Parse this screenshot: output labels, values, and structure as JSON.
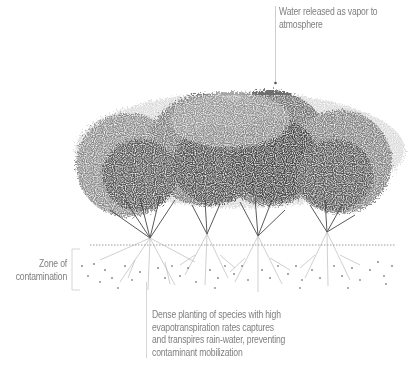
{
  "diagram": {
    "type": "phytoremediation-section",
    "annotations": {
      "top": "Water released as vapor to atmosphere",
      "top_lines": [
        "Water released as vapor to",
        "atmosphere"
      ],
      "left_lines": [
        "Zone of",
        "contamination"
      ],
      "bottom_lines": [
        "Dense planting of species with high",
        "evapotranspiration rates captures",
        "and transpires rain-water, preventing",
        "contaminant mobilization"
      ]
    },
    "elements": {
      "shrubs": 4,
      "ground_line": "dotted",
      "contaminant_particles": "scattered dots below ground line"
    },
    "colors": {
      "foliage_dark": "#3a3a3a",
      "foliage_mid": "#6a6a6a",
      "foliage_light": "#a8a8a8",
      "roots": "#8c8c8c",
      "text": "#808080",
      "leader_line": "#b5b5b5"
    }
  }
}
